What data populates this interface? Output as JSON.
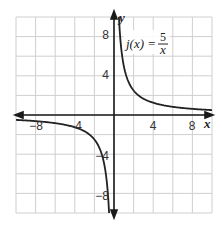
{
  "chart_data": {
    "type": "line",
    "title": "",
    "xlabel": "x",
    "ylabel": "y",
    "xlim": [
      -10,
      10
    ],
    "ylim": [
      -10,
      10
    ],
    "grid": true,
    "grid_step": 2,
    "x_tick_labels": [
      {
        "value": -8,
        "label": "−8"
      },
      {
        "value": -4,
        "label": "−4"
      },
      {
        "value": 4,
        "label": "4"
      },
      {
        "value": 8,
        "label": "8"
      }
    ],
    "y_tick_labels": [
      {
        "value": 8,
        "label": "8"
      },
      {
        "value": 4,
        "label": "4"
      },
      {
        "value": -4,
        "label": "−4"
      },
      {
        "value": -8,
        "label": "−8"
      }
    ],
    "series": [
      {
        "name": "j(x) = 5/x",
        "function": "5/x",
        "branches": [
          {
            "x": [
              0.5,
              0.625,
              0.75,
              1,
              1.25,
              1.5,
              2,
              2.5,
              3,
              4,
              5,
              6,
              7,
              8,
              9,
              10
            ],
            "y": [
              10,
              8,
              6.67,
              5,
              4,
              3.33,
              2.5,
              2,
              1.67,
              1.25,
              1,
              0.83,
              0.71,
              0.63,
              0.56,
              0.5
            ]
          },
          {
            "x": [
              -10,
              -9,
              -8,
              -7,
              -6,
              -5,
              -4,
              -3,
              -2.5,
              -2,
              -1.5,
              -1.25,
              -1,
              -0.75,
              -0.625,
              -0.5
            ],
            "y": [
              -0.5,
              -0.56,
              -0.63,
              -0.71,
              -0.83,
              -1,
              -1.25,
              -1.67,
              -2,
              -2.5,
              -3.33,
              -4,
              -5,
              -6.67,
              -8,
              -10
            ]
          }
        ],
        "color": "#222222"
      }
    ],
    "annotations": [
      {
        "text_prefix": "j(x) =",
        "fraction_numerator": "5",
        "fraction_denominator": "x",
        "x": 1.2,
        "y": 7
      }
    ],
    "legend": "none"
  },
  "labels": {
    "x_axis": "x",
    "y_axis": "y",
    "func_prefix": "j(x) =",
    "func_num": "5",
    "func_den": "x",
    "x_ticks": [
      "−8",
      "−4",
      "4",
      "8"
    ],
    "y_ticks": [
      "8",
      "4",
      "−4",
      "−8"
    ]
  },
  "colors": {
    "grid": "#cfcfcf",
    "axis": "#1a1a1a",
    "curve": "#222222",
    "background": "#ffffff"
  }
}
